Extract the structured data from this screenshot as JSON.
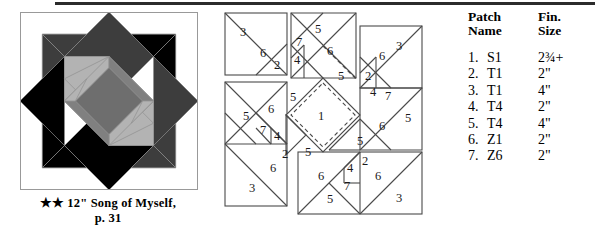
{
  "block": {
    "caption_stars": "★★",
    "caption_text": "12\" Song of Myself,",
    "caption_page": "p. 31",
    "colors": {
      "black": "#000000",
      "dark_gray": "#3d3d3d",
      "mid_gray": "#808080",
      "light_gray": "#b3b3b3",
      "white": "#ffffff",
      "outline": "#9a9a9a"
    }
  },
  "piecing": {
    "unit_top_left": {
      "labels": [
        "3",
        "6",
        "2"
      ]
    },
    "unit_top_center": {
      "labels": [
        "5",
        "7",
        "4",
        "6",
        "5"
      ]
    },
    "unit_top_right": {
      "labels": [
        "3",
        "6",
        "2",
        "4",
        "7",
        "5"
      ]
    },
    "unit_center": {
      "labels": [
        "1"
      ]
    },
    "unit_left": {
      "labels": [
        "5",
        "6",
        "5",
        "7",
        "4",
        "2",
        "6",
        "3"
      ]
    },
    "unit_right": {
      "labels": [
        "6",
        "5",
        "5"
      ]
    },
    "unit_bottom_center": {
      "labels": [
        "5",
        "6",
        "4",
        "2",
        "7",
        "5"
      ]
    },
    "unit_bottom_right": {
      "labels": [
        "6",
        "3"
      ]
    },
    "all_patch_numbers": [
      "1",
      "2",
      "3",
      "4",
      "5",
      "6",
      "7"
    ]
  },
  "table": {
    "headers": {
      "name_line1": "Patch",
      "name_line2": "Name",
      "size_line1": "Fin.",
      "size_line2": "Size"
    },
    "rows": [
      {
        "num": "1.",
        "name": "S1",
        "size": "2¾+",
        "size_whole": "2",
        "size_frac": "¾",
        "size_suffix": "+"
      },
      {
        "num": "2.",
        "name": "T1",
        "size": "2\"",
        "size_whole": "2",
        "size_frac": "",
        "size_suffix": "\""
      },
      {
        "num": "3.",
        "name": "T1",
        "size": "4\"",
        "size_whole": "4",
        "size_frac": "",
        "size_suffix": "\""
      },
      {
        "num": "4.",
        "name": "T4",
        "size": "2\"",
        "size_whole": "2",
        "size_frac": "",
        "size_suffix": "\""
      },
      {
        "num": "5.",
        "name": "T4",
        "size": "4\"",
        "size_whole": "4",
        "size_frac": "",
        "size_suffix": "\""
      },
      {
        "num": "6.",
        "name": "Z1",
        "size": "2\"",
        "size_whole": "2",
        "size_frac": "",
        "size_suffix": "\""
      },
      {
        "num": "7.",
        "name": "Z6",
        "size": "2\"",
        "size_whole": "2",
        "size_frac": "",
        "size_suffix": "\""
      }
    ]
  }
}
